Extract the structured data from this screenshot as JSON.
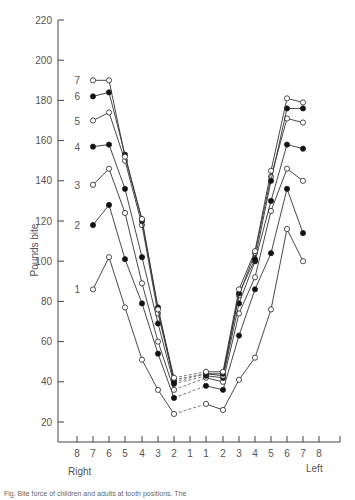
{
  "chart_data": {
    "type": "line",
    "title": "",
    "ylabel": "Pounds bite",
    "xlabel_left_side": "Right",
    "xlabel_right_side": "Left",
    "ylim": [
      20,
      220
    ],
    "yticks": [
      20,
      40,
      60,
      80,
      100,
      120,
      140,
      160,
      180,
      200,
      220
    ],
    "x_tick_labels": [
      "8",
      "7",
      "6",
      "5",
      "4",
      "3",
      "2",
      "1",
      "1",
      "2",
      "3",
      "4",
      "5",
      "6",
      "7",
      "8"
    ],
    "x": [
      "R7",
      "R6",
      "R5",
      "R4",
      "R3",
      "R2",
      "L1",
      "L2",
      "L3",
      "L4",
      "L5",
      "L6",
      "L7"
    ],
    "dashed_segment": "R2 to L1 (across midline)",
    "series": [
      {
        "name": "1",
        "marker": "open",
        "values": [
          86,
          102,
          77,
          51,
          36,
          24,
          29,
          26,
          41,
          52,
          76,
          116,
          100
        ]
      },
      {
        "name": "2",
        "marker": "filled",
        "values": [
          118,
          128,
          101,
          79,
          54,
          32,
          38,
          36,
          63,
          86,
          104,
          136,
          114
        ]
      },
      {
        "name": "3",
        "marker": "open",
        "values": [
          138,
          146,
          124,
          89,
          60,
          36,
          42,
          40,
          74,
          92,
          125,
          146,
          140
        ]
      },
      {
        "name": "4",
        "marker": "filled",
        "values": [
          157,
          158,
          136,
          102,
          69,
          39,
          43,
          42,
          79,
          100,
          130,
          158,
          156
        ]
      },
      {
        "name": "5",
        "marker": "open",
        "values": [
          170,
          174,
          150,
          118,
          74,
          41,
          44,
          43,
          83,
          104,
          142,
          171,
          169
        ]
      },
      {
        "name": "6",
        "marker": "filled",
        "values": [
          182,
          184,
          153,
          120,
          77,
          40,
          44,
          44,
          84,
          101,
          140,
          176,
          176
        ]
      },
      {
        "name": "7",
        "marker": "open",
        "values": [
          190,
          190,
          152,
          121,
          76,
          42,
          45,
          45,
          86,
          105,
          145,
          181,
          179
        ]
      }
    ]
  },
  "axis": {
    "ylabel": "Pounds bite",
    "right_label": "Right",
    "left_label": "Left"
  },
  "caption": "Fig. Bite force of children and adults at tooth positions. The"
}
